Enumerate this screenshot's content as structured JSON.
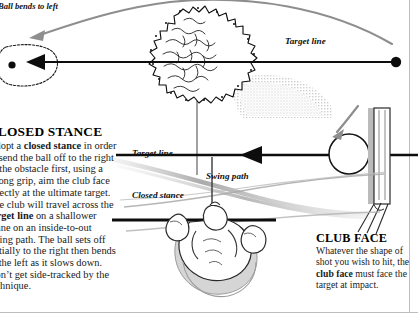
{
  "page": {
    "kind": "golf-instruction-diagram",
    "background": "#ffffff",
    "border_color": "#b9b9b9",
    "ink": "#111111",
    "gray": "#9a9a9a"
  },
  "callouts": {
    "ball_bends_to_left": "Ball bends to left",
    "target_line_top": "Target line",
    "target_line_mid": "Target line",
    "swing_path": "Swing path",
    "closed_stance": "Closed stance"
  },
  "blocks": {
    "closed_stance": {
      "heading": "CLOSED STANCE",
      "body_runs": [
        {
          "text": "Adopt a ",
          "bold": false
        },
        {
          "text": "closed stance",
          "bold": true
        },
        {
          "text": " in order to send the ball off to the right of the obstacle first, using a strong grip, aim the club face directly at the ultimate target. The club will travel across the ",
          "bold": false
        },
        {
          "text": "target line",
          "bold": true
        },
        {
          "text": " on a shallower plane on an inside-to-out swing path. The ball sets off initially to the right then bends to the left as it slows down. Don’t get side-tracked by the technique.",
          "bold": false
        }
      ]
    },
    "club_face": {
      "heading": "CLUB FACE",
      "body_runs": [
        {
          "text": "Whatever the shape of shot you wish to hit, the ",
          "bold": false
        },
        {
          "text": "club face",
          "bold": true
        },
        {
          "text": " must face the target at impact.",
          "bold": false
        }
      ]
    }
  },
  "figure_elements": {
    "tree": "tree-obstacle",
    "green": "putting-green",
    "hole": "hole-marker",
    "bunker": "halftone-rough-area",
    "ball_top": "golf-ball-top",
    "ball_main": "golf-ball-main",
    "club": "club-shaft-and-face",
    "golfer": "golfer-overhead-view",
    "flight_arrow": "ball-flight-curve-arrow",
    "target_arrow_top": "target-line-arrow-top",
    "target_arrow_mid": "target-line-arrow-mid",
    "stance_line": "closed-stance-line",
    "swing_curves": "swing-path-curves"
  }
}
